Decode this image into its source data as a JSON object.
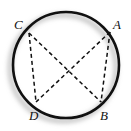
{
  "figure": {
    "background_color": "#ffffff",
    "stroke_color": "#111111",
    "shadow_color": "#b0b0b0",
    "circle": {
      "center_x": 66,
      "center_y": 65,
      "radius": 53,
      "stroke_width": 2.6,
      "shadow_offset_x": -3,
      "shadow_offset_y": 3,
      "shadow_blur": 2.5
    },
    "points": [
      {
        "id": "A",
        "label": "A",
        "x": 110,
        "y": 32,
        "label_x": 113,
        "label_y": 18
      },
      {
        "id": "B",
        "label": "B",
        "x": 101,
        "y": 102,
        "label_x": 100,
        "label_y": 109
      },
      {
        "id": "C",
        "label": "C",
        "x": 29,
        "y": 33,
        "label_x": 14,
        "label_y": 18
      },
      {
        "id": "D",
        "label": "D",
        "x": 36,
        "y": 102,
        "label_x": 29,
        "label_y": 109
      }
    ],
    "chords": [
      {
        "id": "chord-CB",
        "from": "C",
        "to": "B",
        "style": "dashed"
      },
      {
        "id": "chord-AD",
        "from": "A",
        "to": "D",
        "style": "dashed"
      },
      {
        "id": "chord-CD",
        "from": "C",
        "to": "D",
        "style": "dashed"
      },
      {
        "id": "chord-AB",
        "from": "A",
        "to": "B",
        "style": "dashed"
      }
    ],
    "chord_style": {
      "stroke_width": 1.5,
      "dash_array": "4 3"
    }
  }
}
